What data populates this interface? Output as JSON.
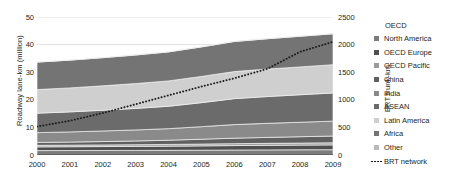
{
  "chart_data": {
    "type": "area",
    "title": "",
    "subtitle": "",
    "xlabel": "",
    "ylabel": "Roadway lane-km (million)",
    "y2label": "BRT trunk-km",
    "categories": [
      "2000",
      "2001",
      "2002",
      "2003",
      "2004",
      "2005",
      "2006",
      "2007",
      "2008",
      "2009"
    ],
    "x": [
      2000,
      2001,
      2002,
      2003,
      2004,
      2005,
      2006,
      2007,
      2008,
      2009
    ],
    "ylim": [
      0,
      50
    ],
    "yticks": [
      "0",
      "10",
      "20",
      "30",
      "40",
      "50"
    ],
    "ytick_values": [
      0,
      10,
      20,
      30,
      40,
      50
    ],
    "y2lim": [
      0,
      2500
    ],
    "y2ticks": [
      "0",
      "500",
      "1000",
      "1500",
      "2000",
      "2500"
    ],
    "y2tick_values": [
      0,
      500,
      1000,
      1500,
      2000,
      2500
    ],
    "grid": true,
    "grid_axis": "y",
    "legend_position": "right",
    "stacked": true,
    "stack_order": "bottom-to-top",
    "series": [
      {
        "name": "OECD North America",
        "color": "#7c7c7c",
        "values": [
          1.6,
          1.62,
          1.64,
          1.66,
          1.7,
          1.74,
          1.8,
          1.84,
          1.88,
          1.92
        ]
      },
      {
        "name": "OECD Europe",
        "color": "#4f4f4f",
        "values": [
          1.35,
          1.38,
          1.42,
          1.46,
          1.5,
          1.56,
          1.62,
          1.66,
          1.7,
          1.74
        ]
      },
      {
        "name": "OECD Pacific",
        "color": "#9a9a9a",
        "values": [
          0.55,
          0.57,
          0.59,
          0.61,
          0.63,
          0.66,
          0.7,
          0.72,
          0.74,
          0.76
        ]
      },
      {
        "name": "China",
        "color": "#606060",
        "values": [
          1.05,
          1.12,
          1.22,
          1.35,
          1.52,
          1.75,
          1.98,
          2.15,
          2.3,
          2.45
        ]
      },
      {
        "name": "India",
        "color": "#8a8a8a",
        "values": [
          3.55,
          3.68,
          3.84,
          4.0,
          4.2,
          4.55,
          4.92,
          5.1,
          5.25,
          5.4
        ]
      },
      {
        "name": "ASEAN",
        "color": "#6b6b6b",
        "values": [
          7.05,
          7.25,
          7.5,
          7.8,
          8.1,
          8.7,
          9.4,
          9.7,
          9.95,
          10.2
        ]
      },
      {
        "name": "Latin America",
        "color": "#cfcfcf",
        "values": [
          8.55,
          8.7,
          8.85,
          9.0,
          9.2,
          9.5,
          9.8,
          9.95,
          10.1,
          10.25
        ]
      },
      {
        "name": "Africa",
        "color": "#747474",
        "values": [
          9.95,
          10.05,
          10.2,
          10.35,
          10.5,
          10.7,
          10.9,
          11.0,
          11.1,
          11.2
        ]
      },
      {
        "name": "Other",
        "color": "#b9b9b9",
        "values": [
          0.05,
          0.05,
          0.05,
          0.05,
          0.05,
          0.05,
          0.05,
          0.05,
          0.05,
          0.05
        ]
      }
    ],
    "series_totals": [
      33.7,
      34.42,
      35.31,
      36.28,
      37.4,
      39.21,
      41.17,
      42.17,
      43.07,
      43.97
    ],
    "overlay_line": {
      "name": "BRT network",
      "axis": "y2",
      "style": "dotted",
      "color": "#1a1a1a",
      "values": [
        515,
        620,
        760,
        920,
        1080,
        1240,
        1390,
        1560,
        1870,
        2050
      ]
    }
  },
  "axes": {
    "left_title": "Roadway lane-km (million)",
    "right_title": "BRT trunk-km",
    "left_ticks": [
      "50",
      "40",
      "30",
      "20",
      "10",
      "0"
    ],
    "right_ticks": [
      "2500",
      "2000",
      "1500",
      "1000",
      "500",
      "0"
    ],
    "x_ticks": [
      "2000",
      "2001",
      "2002",
      "2003",
      "2004",
      "2005",
      "2006",
      "2007",
      "2008",
      "2009"
    ]
  },
  "legend": {
    "header": "OECD",
    "items": [
      {
        "label": "North America",
        "color": "#7c7c7c",
        "marker": "swatch"
      },
      {
        "label": "OECD Europe",
        "color": "#4f4f4f",
        "marker": "swatch"
      },
      {
        "label": "OECD Pacific",
        "color": "#9a9a9a",
        "marker": "swatch"
      },
      {
        "label": "China",
        "color": "#606060",
        "marker": "swatch"
      },
      {
        "label": "India",
        "color": "#8a8a8a",
        "marker": "swatch"
      },
      {
        "label": "ASEAN",
        "color": "#6b6b6b",
        "marker": "swatch"
      },
      {
        "label": "Latin America",
        "color": "#cfcfcf",
        "marker": "swatch"
      },
      {
        "label": "Africa",
        "color": "#747474",
        "marker": "swatch"
      },
      {
        "label": "Other",
        "color": "#b9b9b9",
        "marker": "swatch"
      },
      {
        "label": "BRT network",
        "color": "#1a1a1a",
        "marker": "dotted-line"
      }
    ]
  }
}
